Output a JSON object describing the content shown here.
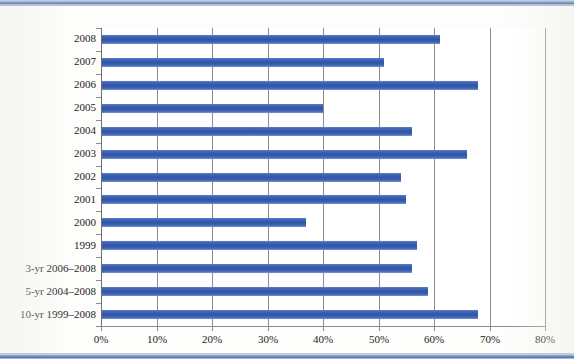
{
  "chart_data": {
    "type": "bar",
    "orientation": "horizontal",
    "title": "",
    "subtitle": "",
    "xlabel": "",
    "ylabel": "",
    "xlim": [
      0,
      80
    ],
    "x_tick_labels": [
      "0%",
      "10%",
      "20%",
      "30%",
      "40%",
      "50%",
      "60%",
      "70%",
      "80%"
    ],
    "x_tick_values": [
      0,
      10,
      20,
      30,
      40,
      50,
      60,
      70,
      80
    ],
    "grid": true,
    "grid_axis": "x",
    "legend": false,
    "value_unit": "%",
    "bar_color": "#3a61b6",
    "categories": [
      "2008",
      "2007",
      "2006",
      "2005",
      "2004",
      "2003",
      "2002",
      "2001",
      "2000",
      "1999",
      "3-yr 2006–2008",
      "5-yr 2004–2008",
      "10-yr 1999–2008"
    ],
    "values": [
      61,
      51,
      68,
      40,
      56,
      66,
      54,
      55,
      37,
      57,
      56,
      59,
      68
    ]
  }
}
